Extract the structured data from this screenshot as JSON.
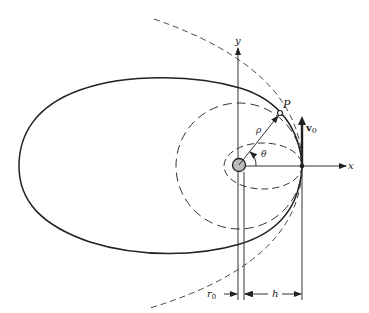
{
  "figure": {
    "labels": {
      "y_axis": "y",
      "x_axis": "x",
      "point": "P",
      "radius": "ρ",
      "angle": "θ",
      "velocity": "v",
      "velocity_sub": "0",
      "r0": "r",
      "r0_sub": "0",
      "h": "h"
    },
    "trajectories": [
      {
        "name": "elliptical-orbit",
        "style": "solid"
      },
      {
        "name": "circular-orbit",
        "style": "dashed"
      },
      {
        "name": "small-elliptical-orbit",
        "style": "dashed"
      },
      {
        "name": "parabolic-escape",
        "style": "dashed"
      }
    ],
    "colors": {
      "ink": "#222222",
      "planet_fill": "#bbbbbb"
    }
  }
}
